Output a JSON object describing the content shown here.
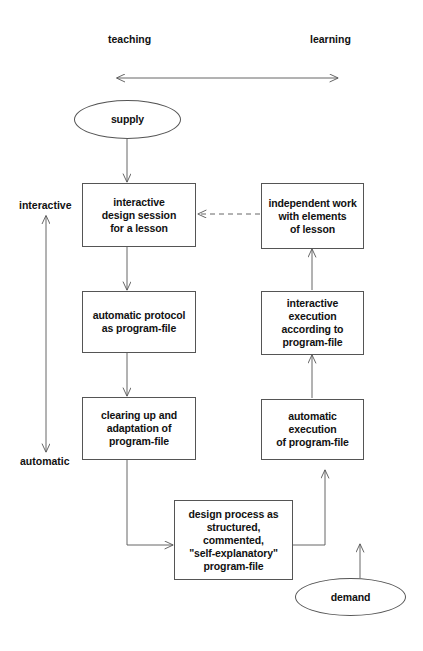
{
  "diagram": {
    "axes": {
      "horizontal": {
        "left_label": "teaching",
        "right_label": "learning",
        "arrow_style": "double-headed"
      },
      "vertical": {
        "top_label": "interactive",
        "bottom_label": "automatic",
        "arrow_style": "double-headed"
      }
    },
    "nodes": [
      {
        "id": "supply",
        "shape": "ellipse",
        "lines": [
          "supply"
        ]
      },
      {
        "id": "interactive-design-session",
        "shape": "box",
        "lines": [
          "interactive",
          "design session",
          "for a lesson"
        ]
      },
      {
        "id": "independent-work",
        "shape": "box",
        "lines": [
          "independent work",
          "with elements",
          "of lesson"
        ]
      },
      {
        "id": "automatic-protocol",
        "shape": "box",
        "lines": [
          "automatic protocol",
          "as program-file"
        ]
      },
      {
        "id": "interactive-execution",
        "shape": "box",
        "lines": [
          "interactive execution",
          "according to",
          "program-file"
        ]
      },
      {
        "id": "clearing-up-adaptation",
        "shape": "box",
        "lines": [
          "clearing up and",
          "adaptation of",
          "program-file"
        ]
      },
      {
        "id": "automatic-execution",
        "shape": "box",
        "lines": [
          "automatic execution",
          "of program-file"
        ]
      },
      {
        "id": "design-process",
        "shape": "box",
        "lines": [
          "design process as",
          "structured,",
          "commented,",
          "\"self-explanatory\"",
          "program-file"
        ]
      },
      {
        "id": "demand",
        "shape": "ellipse",
        "lines": [
          "demand"
        ]
      }
    ],
    "edges": [
      {
        "from": "supply",
        "to": "interactive-design-session",
        "style": "solid",
        "arrow": "end"
      },
      {
        "from": "interactive-design-session",
        "to": "automatic-protocol",
        "style": "solid",
        "arrow": "end"
      },
      {
        "from": "automatic-protocol",
        "to": "clearing-up-adaptation",
        "style": "solid",
        "arrow": "end"
      },
      {
        "from": "clearing-up-adaptation",
        "to": "design-process",
        "style": "solid",
        "arrow": "end"
      },
      {
        "from": "design-process",
        "to": "automatic-execution",
        "style": "solid",
        "arrow": "end"
      },
      {
        "from": "demand",
        "to": "automatic-execution",
        "style": "solid",
        "arrow": "end"
      },
      {
        "from": "automatic-execution",
        "to": "interactive-execution",
        "style": "solid",
        "arrow": "end"
      },
      {
        "from": "interactive-execution",
        "to": "independent-work",
        "style": "solid",
        "arrow": "end"
      },
      {
        "from": "independent-work",
        "to": "interactive-design-session",
        "style": "dashed",
        "arrow": "end"
      }
    ],
    "colors": {
      "stroke": "#555555",
      "text": "#111111",
      "background": "#ffffff"
    }
  }
}
